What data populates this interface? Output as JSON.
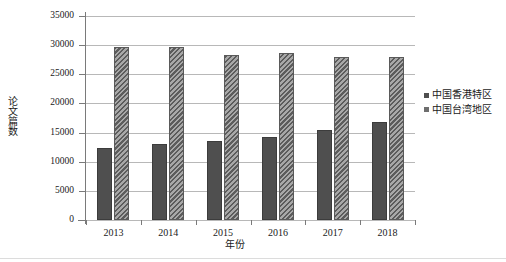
{
  "chart_data": {
    "type": "bar",
    "title": "",
    "subtitle": "",
    "xlabel": "年份",
    "ylabel": "论文篇数",
    "categories": [
      "2013",
      "2014",
      "2015",
      "2016",
      "2017",
      "2018"
    ],
    "series": [
      {
        "name": "中国香港特区",
        "values": [
          12300,
          13000,
          13500,
          14300,
          15500,
          16800
        ],
        "style": "solid",
        "color": "#4f4f4f"
      },
      {
        "name": "中国台湾地区",
        "values": [
          29700,
          29700,
          28300,
          28600,
          27900,
          28000
        ],
        "style": "diagonal-hatch",
        "color": "#9a9a9a"
      }
    ],
    "ylim": [
      0,
      35000
    ],
    "ytick_labels": [
      "0",
      "5000",
      "10000",
      "15000",
      "20000",
      "25000",
      "30000",
      "35000"
    ],
    "ytick_values": [
      0,
      5000,
      10000,
      15000,
      20000,
      25000,
      30000,
      35000
    ],
    "grid": true,
    "grid_axis": "y",
    "legend_position": "right",
    "legend": [
      "中国香港特区",
      "中国台湾地区"
    ]
  }
}
